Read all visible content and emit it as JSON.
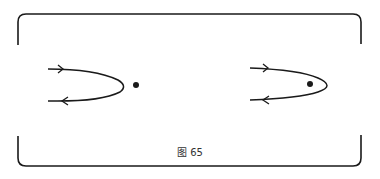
{
  "figure": {
    "caption": "图 65",
    "stroke_color": "#1a1a1a",
    "panels": [
      {
        "name": "left",
        "point_position": "outside curve"
      },
      {
        "name": "right",
        "point_position": "inside curve"
      }
    ]
  }
}
